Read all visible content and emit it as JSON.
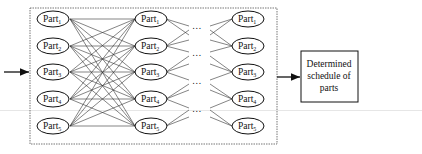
{
  "diagram": {
    "title": "",
    "input_arrow": {
      "direction": "right"
    },
    "container": {
      "style": "dashed"
    },
    "columns": [
      {
        "id": "col1",
        "nodes": [
          "Part",
          "Part",
          "Part",
          "Part",
          "Part"
        ],
        "subscripts": [
          "1",
          "2",
          "3",
          "4",
          "5"
        ]
      },
      {
        "id": "col2",
        "nodes": [
          "Part",
          "Part",
          "Part",
          "Part",
          "Part"
        ],
        "subscripts": [
          "1",
          "2",
          "3",
          "4",
          "5"
        ]
      },
      {
        "id": "col3",
        "nodes": [
          "Part",
          "Part",
          "Part",
          "Part",
          "Part"
        ],
        "subscripts": [
          "1",
          "2",
          "3",
          "4",
          "5"
        ]
      }
    ],
    "ellipsis": "…",
    "output_box": {
      "lines": [
        "Determined",
        "schedule of",
        "parts"
      ]
    },
    "edges": "fully connected between adjacent columns (each Part_i to every Part_j)"
  }
}
